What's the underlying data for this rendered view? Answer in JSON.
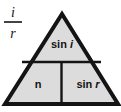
{
  "figure": {
    "name": "snell-law-magic-triangle",
    "background_color": "#ffffff",
    "fill_color": "#dcdcdc",
    "outline_color": "#141414",
    "divider_color": "#141414",
    "text_color": "#141414",
    "fraction": {
      "numerator": "i",
      "denominator": "r"
    },
    "cells": {
      "top": "sin i",
      "top_prefix": "sin",
      "top_variable": "i",
      "bottom_left": "n",
      "bottom_right": "sin r",
      "bottom_right_prefix": "sin",
      "bottom_right_variable": "r"
    }
  }
}
